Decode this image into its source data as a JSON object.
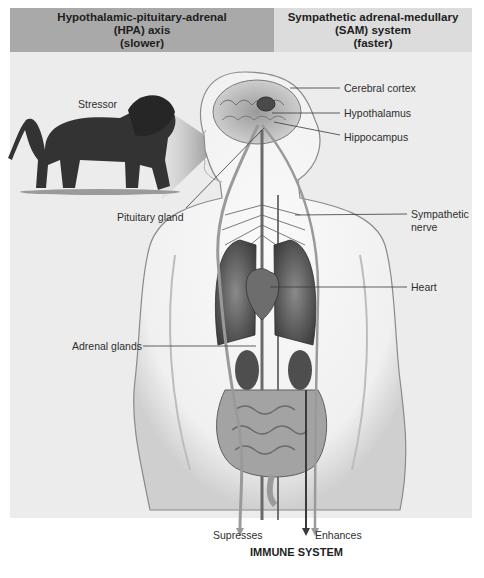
{
  "header": {
    "left": {
      "line1": "Hypothalamic-pituitary-adrenal",
      "line2": "(HPA) axis",
      "line3": "(slower)"
    },
    "right": {
      "line1": "Sympathetic adrenal-medullary",
      "line2": "(SAM) system",
      "line3": "(faster)"
    }
  },
  "labels": {
    "stressor": "Stressor",
    "cerebral_cortex": "Cerebral cortex",
    "hypothalamus": "Hypothalamus",
    "hippocampus": "Hippocampus",
    "pituitary_gland": "Pituitary gland",
    "sympathetic_nerve_line1": "Sympathetic",
    "sympathetic_nerve_line2": "nerve",
    "heart": "Heart",
    "adrenal_glands": "Adrenal glands",
    "supresses": "Supresses",
    "enhances": "Enhances"
  },
  "footer": {
    "immune_system": "IMMUNE SYSTEM"
  },
  "colors": {
    "header_left_bg": "#a9a9a9",
    "header_right_bg": "#dcdcdc",
    "panel_bg": "#ececec",
    "hpa_pathway": "#9a9a9a",
    "sam_pathway": "#3a3a3a"
  }
}
